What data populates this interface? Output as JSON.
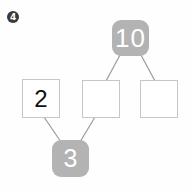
{
  "problem": {
    "number_label": "4",
    "marker_icon": "filled-circle-number-icon",
    "type": "number-bond-decomposition-diagram"
  },
  "colors": {
    "page_background": "#fefefe",
    "gray_node_fill": "#b3b3b3",
    "gray_node_text": "#ffffff",
    "white_node_fill": "#ffffff",
    "white_node_border": "#c6c6c6",
    "white_node_text": "#111111",
    "connector_stroke": "#9a9a9a",
    "marker_fill": "#3a3a3a"
  },
  "nodes": [
    {
      "id": "total-10",
      "label": "10",
      "style": "gray-rounded",
      "filled": true,
      "role": "top-total"
    },
    {
      "id": "addend-2",
      "label": "2",
      "style": "white-square",
      "filled": true,
      "role": "left-addend"
    },
    {
      "id": "blank-middle",
      "label": "",
      "style": "white-square",
      "filled": false,
      "role": "middle-blank"
    },
    {
      "id": "blank-right",
      "label": "",
      "style": "white-square",
      "filled": false,
      "role": "right-blank"
    },
    {
      "id": "sum-3",
      "label": "3",
      "style": "gray-rounded",
      "filled": true,
      "role": "bottom-total"
    }
  ],
  "connectors": [
    {
      "from": "total-10",
      "to": "blank-middle",
      "x1": 120,
      "y1": 55,
      "x2": 106,
      "y2": 81
    },
    {
      "from": "total-10",
      "to": "blank-right",
      "x1": 141,
      "y1": 55,
      "x2": 155,
      "y2": 81
    },
    {
      "from": "addend-2",
      "to": "sum-3",
      "x1": 44,
      "y1": 117,
      "x2": 61,
      "y2": 142
    },
    {
      "from": "blank-middle",
      "to": "sum-3",
      "x1": 95,
      "y1": 117,
      "x2": 80,
      "y2": 142
    }
  ]
}
